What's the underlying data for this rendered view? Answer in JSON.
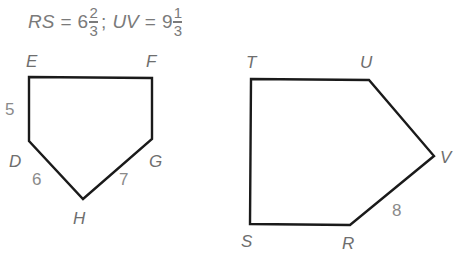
{
  "equation": {
    "lhs1": "RS",
    "eq1": "=",
    "whole1": "6",
    "num1": "2",
    "den1": "3",
    "separator": ";",
    "lhs2": "UV",
    "eq2": "=",
    "whole2": "9",
    "num2": "1",
    "den2": "3"
  },
  "figure1": {
    "name": "DEFGH",
    "vertices": {
      "E": {
        "label": "E",
        "x": 29,
        "y": 77
      },
      "F": {
        "label": "F",
        "x": 152,
        "y": 78
      },
      "G": {
        "label": "G",
        "x": 152,
        "y": 139
      },
      "H": {
        "label": "H",
        "x": 83,
        "y": 199
      },
      "D": {
        "label": "D",
        "x": 29,
        "y": 141
      }
    },
    "side_labels": {
      "DE": "5",
      "DH": "6",
      "GH": "7"
    }
  },
  "figure2": {
    "name": "RSTUV",
    "vertices": {
      "T": {
        "label": "T",
        "x": 251,
        "y": 79
      },
      "U": {
        "label": "U",
        "x": 369,
        "y": 80
      },
      "V": {
        "label": "V",
        "x": 434,
        "y": 156
      },
      "R": {
        "label": "R",
        "x": 350,
        "y": 225
      },
      "S": {
        "label": "S",
        "x": 250,
        "y": 224
      }
    },
    "side_labels": {
      "RV": "8"
    }
  },
  "colors": {
    "stroke": "#1a1a1a",
    "label": "#6e6e6e",
    "number": "#8a8a8a"
  }
}
